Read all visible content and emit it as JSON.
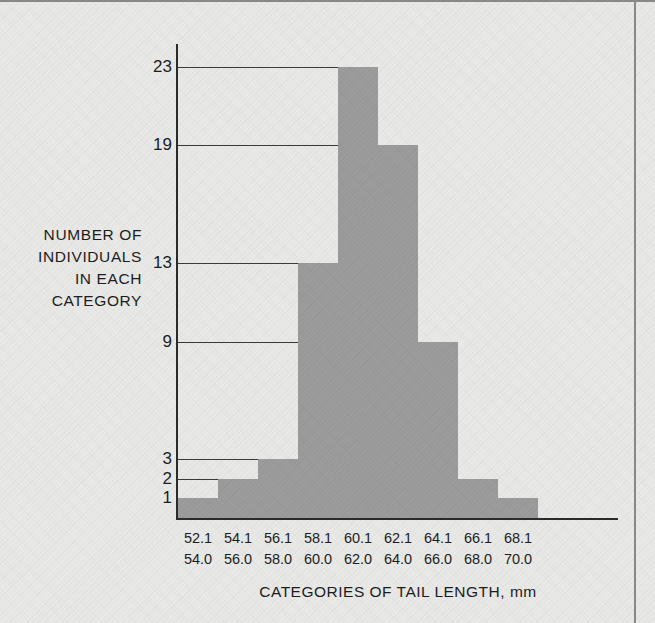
{
  "figure": {
    "y_axis_title_lines": [
      "NUMBER OF",
      "INDIVIDUALS",
      "IN EACH",
      "CATEGORY"
    ],
    "x_axis_title": "CATEGORIES OF TAIL LENGTH, mm",
    "bar_color": "#9c9c9c",
    "axis_color": "#2b2b2b",
    "background_color": "#e9e9e7"
  },
  "chart_data": {
    "type": "bar",
    "title": "",
    "xlabel": "CATEGORIES OF TAIL LENGTH, mm",
    "ylabel": "NUMBER OF INDIVIDUALS IN EACH CATEGORY",
    "categories": [
      "52.1-54.0",
      "54.1-56.0",
      "56.1-58.0",
      "58.1-60.0",
      "60.1-62.0",
      "62.1-64.0",
      "64.1-66.0",
      "66.1-68.0",
      "68.1-70.0"
    ],
    "category_lower_labels": [
      "52.1",
      "54.1",
      "56.1",
      "58.1",
      "60.1",
      "62.1",
      "64.1",
      "66.1",
      "68.1"
    ],
    "category_upper_labels": [
      "54.0",
      "56.0",
      "58.0",
      "60.0",
      "62.0",
      "64.0",
      "66.0",
      "68.0",
      "70.0"
    ],
    "values": [
      1,
      2,
      3,
      13,
      23,
      19,
      9,
      2,
      1
    ],
    "ytick_labels": [
      "1",
      "2",
      "3",
      "9",
      "13",
      "19",
      "23"
    ],
    "yticks": [
      1,
      2,
      3,
      9,
      13,
      19,
      23
    ],
    "ylim": [
      0,
      25
    ],
    "grid": "horizontal-at-ticks",
    "legend": "none",
    "total_individuals": 73
  }
}
